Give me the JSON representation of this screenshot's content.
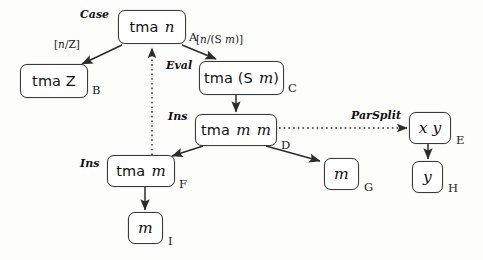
{
  "diagram": {
    "type": "directed-graph",
    "canvas": {
      "width": 483,
      "height": 260,
      "background": "#fdfdfc"
    },
    "colors": {
      "node_border": "#3a3a3a",
      "node_fill": "#ffffff",
      "edge": "#2b2b2b",
      "text": "#111111"
    },
    "nodes": [
      {
        "id": "A",
        "tag": "A",
        "head": "tma",
        "arg": "n",
        "label": "tma n",
        "x": 118,
        "y": 10,
        "w": 68,
        "h": 34,
        "tag_x": 189,
        "tag_y": 30
      },
      {
        "id": "B",
        "tag": "B",
        "head": "tma",
        "arg": "Z",
        "label": "tma Z",
        "x": 20,
        "y": 64,
        "w": 68,
        "h": 34,
        "tag_x": 92,
        "tag_y": 83
      },
      {
        "id": "C",
        "tag": "C",
        "head": "tma",
        "arg": "(S m)",
        "label": "tma (S m)",
        "x": 199,
        "y": 61,
        "w": 85,
        "h": 34,
        "tag_x": 288,
        "tag_y": 81
      },
      {
        "id": "D",
        "tag": "D",
        "head": "tma",
        "arg": "m m",
        "label": "tma m m",
        "x": 195,
        "y": 114,
        "w": 82,
        "h": 32,
        "tag_x": 281,
        "tag_y": 138
      },
      {
        "id": "E",
        "tag": "E",
        "head": "",
        "arg": "x y",
        "label": "x y",
        "x": 409,
        "y": 112,
        "w": 42,
        "h": 32,
        "tag_x": 456,
        "tag_y": 133
      },
      {
        "id": "F",
        "tag": "F",
        "head": "tma",
        "arg": "m",
        "label": "tma m",
        "x": 107,
        "y": 155,
        "w": 68,
        "h": 32,
        "tag_x": 179,
        "tag_y": 177
      },
      {
        "id": "G",
        "tag": "G",
        "head": "",
        "arg": "m",
        "label": "m",
        "x": 324,
        "y": 158,
        "w": 35,
        "h": 32,
        "tag_x": 364,
        "tag_y": 180
      },
      {
        "id": "H",
        "tag": "H",
        "head": "",
        "arg": "y",
        "label": "y",
        "x": 412,
        "y": 161,
        "w": 31,
        "h": 32,
        "tag_x": 448,
        "tag_y": 181
      },
      {
        "id": "I",
        "tag": "I",
        "head": "",
        "arg": "m",
        "label": "m",
        "x": 128,
        "y": 212,
        "w": 35,
        "h": 32,
        "tag_x": 168,
        "tag_y": 234
      }
    ],
    "edges": [
      {
        "id": "edge-a-b",
        "from": "A",
        "to": "B",
        "style": "solid",
        "rule": "Case",
        "subst": "[n/Z]"
      },
      {
        "id": "edge-a-c",
        "from": "A",
        "to": "C",
        "style": "solid",
        "rule": "Eval",
        "subst": "[n/(S m)]"
      },
      {
        "id": "edge-c-d",
        "from": "C",
        "to": "D",
        "style": "solid",
        "rule": "Ins",
        "subst": ""
      },
      {
        "id": "edge-d-e",
        "from": "D",
        "to": "E",
        "style": "dotted",
        "rule": "ParSplit",
        "subst": ""
      },
      {
        "id": "edge-d-f",
        "from": "D",
        "to": "F",
        "style": "solid",
        "rule": "Ins",
        "subst": ""
      },
      {
        "id": "edge-d-g",
        "from": "D",
        "to": "G",
        "style": "solid",
        "rule": "",
        "subst": ""
      },
      {
        "id": "edge-e-h",
        "from": "E",
        "to": "H",
        "style": "solid",
        "rule": "",
        "subst": ""
      },
      {
        "id": "edge-f-i",
        "from": "F",
        "to": "I",
        "style": "solid",
        "rule": "",
        "subst": ""
      },
      {
        "id": "edge-f-a",
        "from": "F",
        "to": "A",
        "style": "dotted",
        "rule": "",
        "subst": ""
      }
    ],
    "rule_labels": [
      {
        "id": "rule-case",
        "text": "Case",
        "x": 80,
        "y": 8
      },
      {
        "id": "rule-eval",
        "text": "Eval",
        "x": 166,
        "y": 59
      },
      {
        "id": "rule-ins-top",
        "text": "Ins",
        "x": 168,
        "y": 110
      },
      {
        "id": "rule-ins-left",
        "text": "Ins",
        "x": 80,
        "y": 157
      },
      {
        "id": "rule-parsplit",
        "text": "ParSplit",
        "x": 351,
        "y": 109
      }
    ],
    "subst_labels": [
      {
        "id": "subst-n-z",
        "pre": "[",
        "body": "n",
        "mid": "/Z",
        "post": "]",
        "x": 54,
        "y": 38
      },
      {
        "id": "subst-n-sm",
        "pre": "[",
        "body": "n",
        "mid": "/(S ",
        "post": "m)]",
        "x": 196,
        "y": 33
      }
    ]
  }
}
